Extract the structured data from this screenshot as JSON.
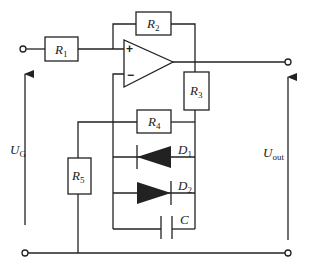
{
  "diagram": {
    "type": "circuit-schematic",
    "components": {
      "R1": {
        "symbol": "R",
        "sub": "1"
      },
      "R2": {
        "symbol": "R",
        "sub": "2"
      },
      "R3": {
        "symbol": "R",
        "sub": "3"
      },
      "R4": {
        "symbol": "R",
        "sub": "4"
      },
      "R5": {
        "symbol": "R",
        "sub": "5"
      },
      "D1": {
        "symbol": "D",
        "sub": "1"
      },
      "D2": {
        "symbol": "D",
        "sub": "2"
      },
      "C": {
        "symbol": "C"
      }
    },
    "opamp": {
      "plus": "+",
      "minus": "−"
    },
    "voltages": {
      "input": {
        "symbol": "U",
        "sub": "G"
      },
      "output": {
        "symbol": "U",
        "sub": "out"
      }
    }
  }
}
